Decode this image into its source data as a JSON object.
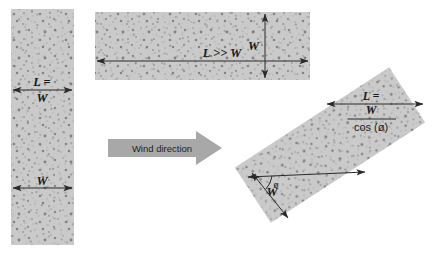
{
  "figure": {
    "type": "diagram",
    "background_color": "#ffffff",
    "fill_color": "#c9c9c9",
    "speckle_color": "#7a7a7a",
    "line_color": "#2a2a2a",
    "arrow_fill": "#a8a8a8"
  },
  "wind_arrow": {
    "label": "Wind direction",
    "direction": "left-to-right",
    "color": "#a8a8a8"
  },
  "panels": [
    {
      "id": "panel-square",
      "name": "square-block",
      "orientation": "vertical",
      "labels": [
        {
          "id": "L-equals-W",
          "line1": "L =",
          "line2": "W",
          "kind": "fraction-less"
        },
        {
          "id": "width",
          "text": "W"
        }
      ],
      "dimension_arrows": [
        {
          "name": "length-arrow",
          "axis": "horizontal",
          "label": "L = W"
        },
        {
          "name": "width-arrow",
          "axis": "horizontal",
          "label": "W"
        }
      ]
    },
    {
      "id": "panel-elongated",
      "name": "elongated-block",
      "orientation": "horizontal",
      "labels": [
        {
          "id": "L-much-greater-W",
          "text": "L >> W"
        },
        {
          "id": "width",
          "text": "W"
        }
      ],
      "dimension_arrows": [
        {
          "name": "length-arrow",
          "axis": "horizontal",
          "label": "L >> W"
        },
        {
          "name": "width-arrow",
          "axis": "vertical",
          "label": "W"
        }
      ]
    },
    {
      "id": "panel-rotated",
      "name": "rotated-block",
      "orientation": "rotated",
      "rotation_degrees": -33,
      "labels": [
        {
          "id": "L-formula-numerator-a",
          "text": "L ="
        },
        {
          "id": "L-formula-numerator-b",
          "text": "W"
        },
        {
          "id": "L-formula-denominator",
          "text": "cos (ø)"
        },
        {
          "id": "width",
          "text": "W"
        },
        {
          "id": "angle",
          "text": "ø"
        }
      ],
      "dimension_arrows": [
        {
          "name": "length-arrow",
          "axis": "horizontal",
          "label": "L = W / cos (ø)"
        },
        {
          "name": "width-arrow",
          "axis": "oblique",
          "label": "W"
        },
        {
          "name": "reference-axis-arrow",
          "axis": "horizontal",
          "label": ""
        }
      ],
      "angle_marker": {
        "symbol": "ø",
        "between": [
          "reference-axis-arrow",
          "width-arrow"
        ]
      }
    }
  ]
}
